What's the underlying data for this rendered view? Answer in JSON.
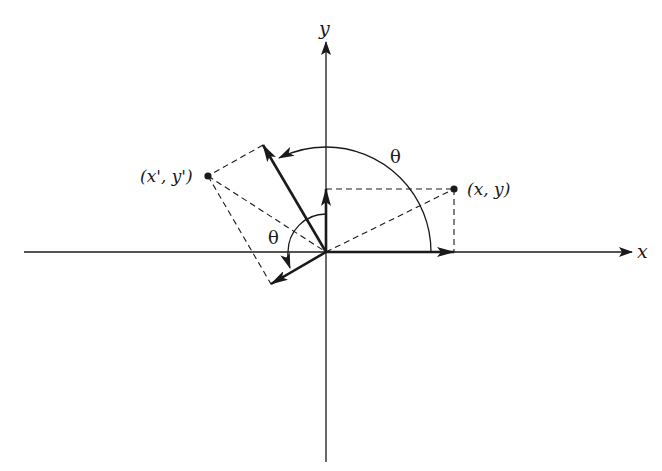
{
  "diagram": {
    "axes": {
      "x_label": "x",
      "y_label": "y"
    },
    "points": {
      "original_label": "(x, y)",
      "rotated_label": "(x', y')"
    },
    "angles": {
      "large_arc_label": "θ",
      "small_arc_label": "θ"
    },
    "colors": {
      "stroke": "#1a1a1a",
      "background": "#ffffff"
    }
  }
}
